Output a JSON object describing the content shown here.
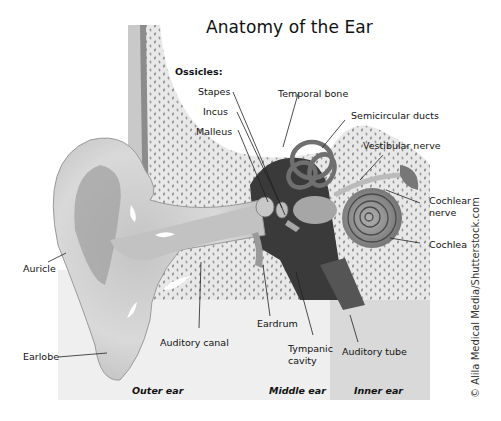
{
  "title": "Anatomy of the Ear",
  "ossicles_heading": "Ossicles:",
  "labels": {
    "stapes": "Stapes",
    "incus": "Incus",
    "malleus": "Malleus",
    "temporal_bone": "Temporal bone",
    "semicircular_ducts": "Semicircular ducts",
    "vestibular_nerve": "Vestibular nerve",
    "cochlear_nerve_line1": "Cochlear",
    "cochlear_nerve_line2": "nerve",
    "cochlea": "Cochlea",
    "auricle": "Auricle",
    "earlobe": "Earlobe",
    "auditory_canal": "Auditory canal",
    "eardrum": "Eardrum",
    "tympanic_cavity_line1": "Tympanic",
    "tympanic_cavity_line2": "cavity",
    "auditory_tube": "Auditory tube"
  },
  "sections": {
    "outer": "Outer ear",
    "middle": "Middle ear",
    "inner": "Inner ear"
  },
  "credit": "© Alila Medical Media/Shutterstock.com",
  "colors": {
    "background": "#ffffff",
    "bone": "#e6e6e6",
    "skin": "#d2d2d2",
    "dark_cavity": "#3a3a3a",
    "inner_panel": "#d9d9d9"
  }
}
